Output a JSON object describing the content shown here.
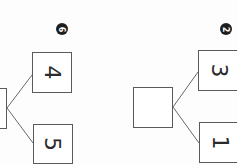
{
  "worksheet": {
    "orientation": "rotated 90 degrees clockwise",
    "bonds": [
      {
        "problem_number": "6",
        "whole": "",
        "parts": [
          "4",
          "5"
        ]
      },
      {
        "problem_number": "2",
        "whole": "",
        "parts": [
          "3",
          "1"
        ]
      }
    ]
  },
  "colors": {
    "line": "#5a5a5a",
    "badge": "#1e1e1e",
    "text": "#2b2b2b"
  }
}
